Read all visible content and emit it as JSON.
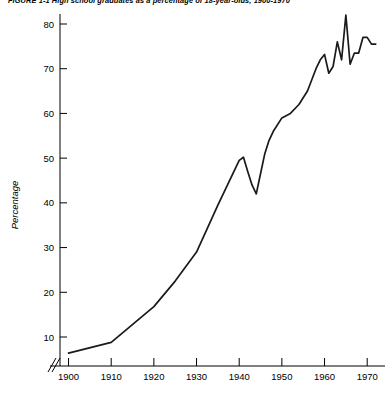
{
  "figure": {
    "title": "FIGURE 1-1   High school graduates as a percentage of 18-year-olds, 1900-1970"
  },
  "chart_data": {
    "type": "line",
    "title": "FIGURE 1-1   High school graduates as a percentage of 18-year-olds, 1900-1970",
    "xlabel": "",
    "ylabel": "Percentage",
    "xlim": [
      1898,
      1973
    ],
    "ylim": [
      4,
      84
    ],
    "xticks": [
      1900,
      1910,
      1920,
      1930,
      1940,
      1950,
      1960,
      1970
    ],
    "xtick_labels": [
      "1900",
      "1910",
      "1920",
      "1930",
      "1940",
      "1950",
      "1960",
      "1970"
    ],
    "yticks": [
      10,
      20,
      30,
      40,
      50,
      60,
      70,
      80
    ],
    "ytick_labels": [
      "10",
      "20",
      "30",
      "40",
      "50",
      "60",
      "70",
      "80"
    ],
    "grid": false,
    "legend": null,
    "axis_break": {
      "axis": "x",
      "position": 1899,
      "style": "double-slash"
    },
    "series": [
      {
        "name": "High school graduates as % of 18-year-olds",
        "color": "#1a1a1a",
        "x": [
          1900,
          1910,
          1920,
          1925,
          1930,
          1935,
          1940,
          1941,
          1942,
          1943,
          1944,
          1945,
          1946,
          1947,
          1948,
          1950,
          1952,
          1954,
          1956,
          1958,
          1959,
          1960,
          1961,
          1962,
          1963,
          1964,
          1965,
          1966,
          1967,
          1968,
          1969,
          1970,
          1971,
          1972
        ],
        "values": [
          6.4,
          8.8,
          16.8,
          22.5,
          29.0,
          39.5,
          49.5,
          50.2,
          47.0,
          44.0,
          42.0,
          46.5,
          51.0,
          54.0,
          56.0,
          59.0,
          60.0,
          62.0,
          65.0,
          70.0,
          72.0,
          73.2,
          69.0,
          70.5,
          76.0,
          72.0,
          82.0,
          71.0,
          73.5,
          73.5,
          77.0,
          77.0,
          75.5,
          75.5
        ]
      }
    ]
  }
}
